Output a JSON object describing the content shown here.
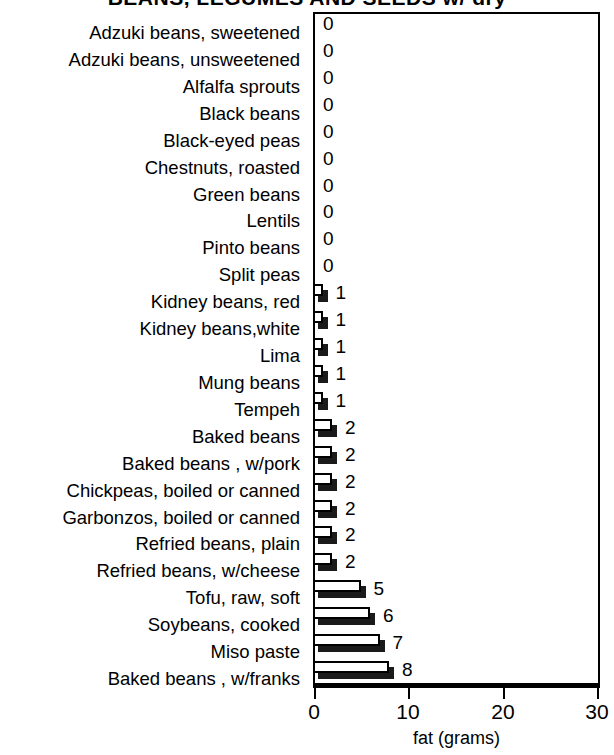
{
  "chart_data": {
    "type": "bar",
    "orientation": "horizontal",
    "title": "BEANS, LEGUMES AND SEEDS w/ dry",
    "title_clipped": true,
    "xlabel": "fat (grams)",
    "ylabel": "",
    "xlim": [
      0,
      30
    ],
    "xticks": [
      0,
      10,
      20,
      30
    ],
    "xtick_labels": [
      "0",
      "10",
      "20",
      "30"
    ],
    "grid": false,
    "legend": false,
    "value_labels_shown": true,
    "categories": [
      "Adzuki beans, sweetened",
      "Adzuki beans, unsweetened",
      "Alfalfa sprouts",
      "Black beans",
      "Black-eyed peas",
      "Chestnuts, roasted",
      "Green beans",
      "Lentils",
      "Pinto beans",
      "Split peas",
      "Kidney beans, red",
      "Kidney beans,white",
      "Lima",
      "Mung beans",
      "Tempeh",
      "Baked beans",
      "Baked beans , w/pork",
      "Chickpeas, boiled or canned",
      "Garbonzos, boiled or canned",
      "Refried beans, plain",
      "Refried beans, w/cheese",
      "Tofu, raw, soft",
      "Soybeans, cooked",
      "Miso paste",
      "Baked beans , w/franks"
    ],
    "values": [
      0,
      0,
      0,
      0,
      0,
      0,
      0,
      0,
      0,
      0,
      1,
      1,
      1,
      1,
      1,
      2,
      2,
      2,
      2,
      2,
      2,
      5,
      6,
      7,
      8
    ],
    "value_label_texts": [
      "0",
      "0",
      "0",
      "0",
      "0",
      "0",
      "0",
      "0",
      "0",
      "0",
      "1",
      "1",
      "1",
      "1",
      "1",
      "2",
      "2",
      "2",
      "2",
      "2",
      "2",
      "5",
      "6",
      "7",
      "8"
    ]
  },
  "style": {
    "bar_face_color": "#ffffff",
    "bar_edge_color": "#000000",
    "bar_shadow_color": "#1a1a1a",
    "axis_color": "#000000",
    "background_color": "#ffffff"
  }
}
